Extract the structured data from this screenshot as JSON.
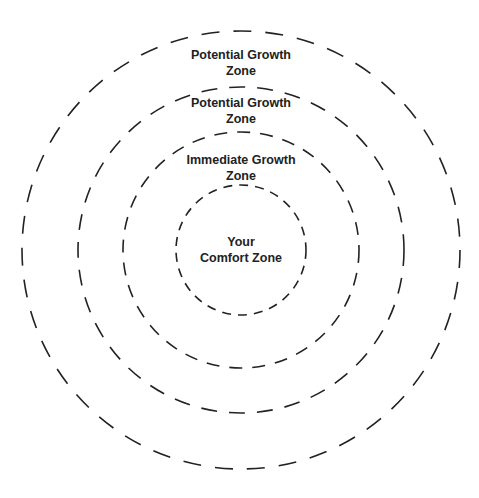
{
  "diagram": {
    "type": "concentric-zones",
    "stroke_color": "#222222",
    "background": "#ffffff",
    "zones": [
      {
        "id": "outer",
        "line1": "Potential Growth",
        "line2": "Zone",
        "cx": 241,
        "cy": 250,
        "r": 219,
        "dash": "18 14",
        "label_x": 241,
        "label_y": 47
      },
      {
        "id": "second",
        "line1": "Potential Growth",
        "line2": "Zone",
        "cx": 241,
        "cy": 250,
        "r": 163,
        "dash": "16 12",
        "label_x": 241,
        "label_y": 95
      },
      {
        "id": "immediate",
        "line1": "Immediate Growth",
        "line2": "Zone",
        "cx": 241,
        "cy": 250,
        "r": 118,
        "dash": "13 10",
        "label_x": 241,
        "label_y": 152
      },
      {
        "id": "comfort",
        "line1": "Your",
        "line2": "Comfort Zone",
        "cx": 241,
        "cy": 250,
        "r": 65,
        "dash": "9 7",
        "label_x": 241,
        "label_y": 234
      }
    ]
  }
}
